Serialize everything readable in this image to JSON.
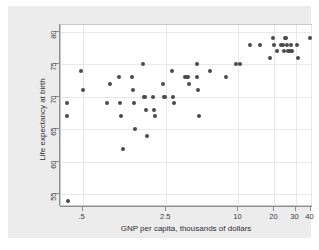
{
  "chart_data": {
    "type": "scatter",
    "title": "",
    "xlabel": "GNP per capita, thousands of dollars",
    "ylabel": "Life expectancy at birth",
    "xscale": "log",
    "yscale": "linear",
    "xlim": [
      0.33,
      42
    ],
    "ylim": [
      53.0,
      81.0
    ],
    "xticks": [
      0.5,
      2.5,
      10,
      20,
      30,
      40
    ],
    "xticklabels": [
      ".5",
      "2.5",
      "10",
      "20",
      "30",
      "40"
    ],
    "yticks": [
      55,
      60,
      65,
      70,
      75,
      80
    ],
    "yticklabels": [
      "55",
      "60",
      "65",
      "70",
      "75",
      "80"
    ],
    "grid": true,
    "legend": "none",
    "marker": {
      "shape": "circle",
      "color": "#4a4a4e",
      "size": 4
    },
    "points": [
      {
        "x": 0.37,
        "y": 69
      },
      {
        "x": 0.37,
        "y": 67
      },
      {
        "x": 0.38,
        "y": 54
      },
      {
        "x": 0.48,
        "y": 74
      },
      {
        "x": 0.5,
        "y": 71
      },
      {
        "x": 0.8,
        "y": 69
      },
      {
        "x": 0.85,
        "y": 72
      },
      {
        "x": 1.0,
        "y": 73
      },
      {
        "x": 1.02,
        "y": 69
      },
      {
        "x": 1.05,
        "y": 67
      },
      {
        "x": 1.08,
        "y": 62
      },
      {
        "x": 1.3,
        "y": 73
      },
      {
        "x": 1.32,
        "y": 71
      },
      {
        "x": 1.35,
        "y": 69
      },
      {
        "x": 1.38,
        "y": 65
      },
      {
        "x": 1.6,
        "y": 75
      },
      {
        "x": 1.62,
        "y": 70
      },
      {
        "x": 1.65,
        "y": 70
      },
      {
        "x": 1.68,
        "y": 68
      },
      {
        "x": 1.72,
        "y": 64
      },
      {
        "x": 1.95,
        "y": 70
      },
      {
        "x": 1.98,
        "y": 68
      },
      {
        "x": 2.0,
        "y": 67
      },
      {
        "x": 2.35,
        "y": 72
      },
      {
        "x": 2.4,
        "y": 70
      },
      {
        "x": 2.45,
        "y": 70
      },
      {
        "x": 2.8,
        "y": 74
      },
      {
        "x": 2.85,
        "y": 70
      },
      {
        "x": 2.9,
        "y": 69
      },
      {
        "x": 3.6,
        "y": 73
      },
      {
        "x": 3.7,
        "y": 73
      },
      {
        "x": 3.78,
        "y": 73
      },
      {
        "x": 3.85,
        "y": 72
      },
      {
        "x": 4.5,
        "y": 75
      },
      {
        "x": 4.55,
        "y": 73
      },
      {
        "x": 4.6,
        "y": 71
      },
      {
        "x": 4.7,
        "y": 67
      },
      {
        "x": 5.8,
        "y": 74
      },
      {
        "x": 7.8,
        "y": 73
      },
      {
        "x": 9.6,
        "y": 75
      },
      {
        "x": 10.4,
        "y": 75
      },
      {
        "x": 12.5,
        "y": 78
      },
      {
        "x": 15.0,
        "y": 78
      },
      {
        "x": 18.5,
        "y": 76
      },
      {
        "x": 19.5,
        "y": 79
      },
      {
        "x": 20.0,
        "y": 78
      },
      {
        "x": 21.0,
        "y": 77
      },
      {
        "x": 22.5,
        "y": 78
      },
      {
        "x": 23.5,
        "y": 78
      },
      {
        "x": 23.8,
        "y": 77
      },
      {
        "x": 24.5,
        "y": 79
      },
      {
        "x": 25.0,
        "y": 79
      },
      {
        "x": 25.5,
        "y": 78
      },
      {
        "x": 25.8,
        "y": 77
      },
      {
        "x": 26.8,
        "y": 77
      },
      {
        "x": 27.5,
        "y": 78
      },
      {
        "x": 28.0,
        "y": 77
      },
      {
        "x": 31.0,
        "y": 78
      },
      {
        "x": 31.5,
        "y": 76
      },
      {
        "x": 39.5,
        "y": 79
      }
    ]
  }
}
